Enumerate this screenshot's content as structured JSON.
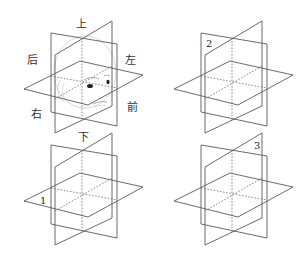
{
  "figure": {
    "panels": [
      {
        "id": "head-reference",
        "position": "top-left",
        "has_head": true,
        "labels": {
          "top": "上",
          "bottom": "下",
          "back": "后",
          "left": "左",
          "right": "右",
          "front": "前"
        }
      },
      {
        "id": "plane-2",
        "position": "top-right",
        "number_label": "2"
      },
      {
        "id": "plane-1",
        "position": "bottom-left",
        "number_label": "1"
      },
      {
        "id": "plane-3",
        "position": "bottom-right",
        "number_label": "3"
      }
    ],
    "colors": {
      "line": "#5a5a5a",
      "dotted": "#6a6a6a",
      "head_outline": "#c9c9c9",
      "text": "#333333",
      "background": "#ffffff"
    }
  }
}
